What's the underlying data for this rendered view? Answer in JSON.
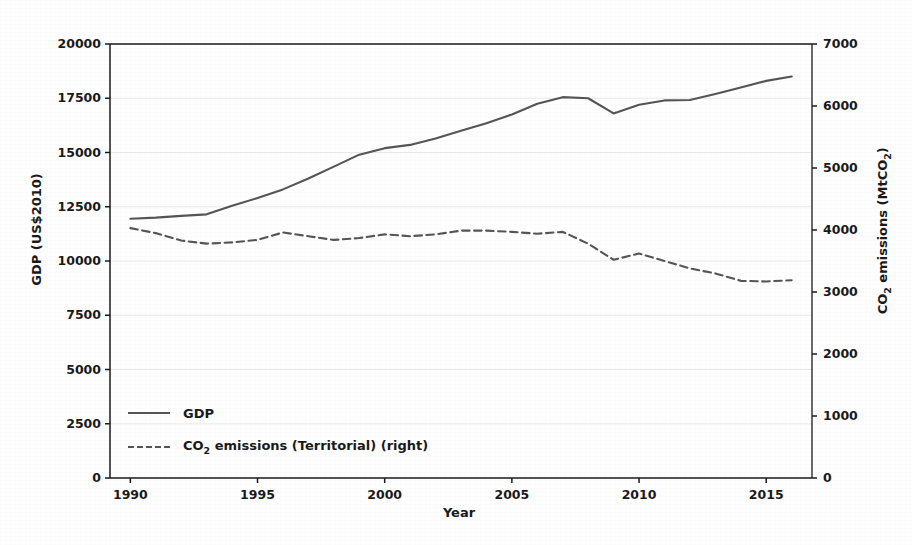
{
  "chart_data": {
    "type": "line",
    "title": "",
    "xlabel": "Year",
    "ylabel": "GDP (US$2010)",
    "ylabel_right": "CO2 emissions (MtCO2)",
    "xlim": [
      1989.2,
      2016.8
    ],
    "ylim": [
      0,
      20000
    ],
    "ylim_right": [
      0,
      7000
    ],
    "grid": true,
    "legend_position": "lower left inside",
    "x": [
      1990,
      1991,
      1992,
      1993,
      1994,
      1995,
      1996,
      1997,
      1998,
      1999,
      2000,
      2001,
      2002,
      2003,
      2004,
      2005,
      2006,
      2007,
      2008,
      2009,
      2010,
      2011,
      2012,
      2013,
      2014,
      2015,
      2016
    ],
    "xticks": [
      1990,
      1995,
      2000,
      2005,
      2010,
      2015
    ],
    "yticks": [
      0,
      2500,
      5000,
      7500,
      10000,
      12500,
      15000,
      17500,
      20000
    ],
    "yticks_right": [
      0,
      1000,
      2000,
      3000,
      4000,
      5000,
      6000,
      7000
    ],
    "series": [
      {
        "name": "GDP",
        "axis": "left",
        "style": "solid",
        "color": "#555555",
        "values": [
          11950,
          12000,
          12080,
          12150,
          12550,
          12900,
          13300,
          13800,
          14350,
          14900,
          15200,
          15350,
          15650,
          16000,
          16350,
          16750,
          17250,
          17550,
          17500,
          16800,
          17200,
          17400,
          17420,
          17700,
          18000,
          18300,
          18500
        ]
      },
      {
        "name": "CO2 emissions (Territorial) (right)",
        "axis": "right",
        "style": "dashed",
        "color": "#555555",
        "values": [
          4030,
          3950,
          3830,
          3780,
          3800,
          3840,
          3960,
          3900,
          3840,
          3870,
          3930,
          3900,
          3930,
          3990,
          3990,
          3970,
          3940,
          3970,
          3780,
          3520,
          3620,
          3500,
          3380,
          3300,
          3180,
          3170,
          3190
        ]
      }
    ]
  },
  "axes": {
    "xlabel": "Year",
    "ylabel_left_prefix": "GDP (US$2010)",
    "ylabel_right_prefix": "CO",
    "ylabel_right_sub1": "2",
    "ylabel_right_mid": " emissions (MtCO",
    "ylabel_right_sub2": "2",
    "ylabel_right_suffix": ")"
  },
  "legend": {
    "items": [
      {
        "label": "GDP",
        "style": "solid"
      },
      {
        "label_prefix": "CO",
        "label_sub": "2",
        "label_suffix": " emissions (Territorial) (right)",
        "style": "dashed"
      }
    ]
  },
  "colors": {
    "line": "#555555",
    "axis": "#1a1a1a",
    "grid": "#e8e8e8",
    "background": "#fefefe"
  }
}
